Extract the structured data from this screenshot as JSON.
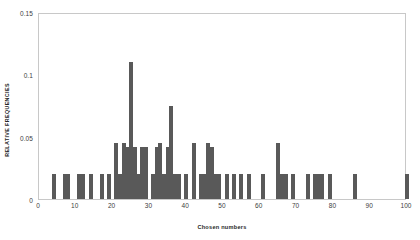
{
  "chart_data": {
    "type": "bar",
    "title": "",
    "xlabel": "Chosen numbers",
    "ylabel": "RELATIVE FREQUENCIES",
    "xlim": [
      0,
      100
    ],
    "ylim": [
      0,
      0.15
    ],
    "grid": false,
    "legend": null,
    "bar_color": "#595959",
    "frame_color": "#c8c8c8",
    "y_ticks": [
      0,
      0.05,
      0.1,
      0.15
    ],
    "y_tick_labels": [
      "0",
      "0.05",
      "0.1",
      "0.15"
    ],
    "x_ticks": [
      0,
      10,
      20,
      30,
      40,
      50,
      60,
      70,
      80,
      90,
      100
    ],
    "x_tick_labels": [
      "0",
      "10",
      "20",
      "30",
      "40",
      "50",
      "60",
      "70",
      "80",
      "90",
      "100"
    ],
    "x": [
      4,
      7,
      8,
      11,
      12,
      14,
      17,
      19,
      21,
      22,
      23,
      24,
      25,
      26,
      27,
      28,
      29,
      31,
      32,
      33,
      34,
      35,
      36,
      37,
      38,
      40,
      42,
      44,
      45,
      46,
      47,
      48,
      49,
      51,
      53,
      55,
      57,
      61,
      65,
      66,
      67,
      69,
      73,
      75,
      76,
      77,
      79,
      86,
      100
    ],
    "values": [
      0.02,
      0.02,
      0.02,
      0.02,
      0.02,
      0.02,
      0.02,
      0.02,
      0.045,
      0.02,
      0.045,
      0.042,
      0.11,
      0.042,
      0.02,
      0.042,
      0.042,
      0.02,
      0.042,
      0.045,
      0.02,
      0.042,
      0.075,
      0.02,
      0.02,
      0.02,
      0.045,
      0.02,
      0.02,
      0.045,
      0.042,
      0.02,
      0.02,
      0.02,
      0.02,
      0.02,
      0.02,
      0.02,
      0.045,
      0.02,
      0.02,
      0.02,
      0.02,
      0.02,
      0.02,
      0.02,
      0.02,
      0.02,
      0.02
    ]
  }
}
